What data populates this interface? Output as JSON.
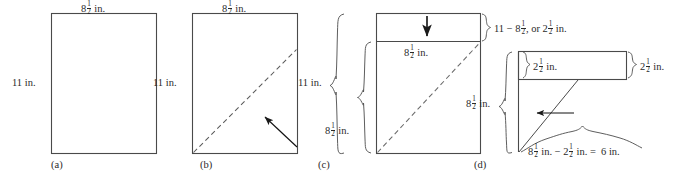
{
  "figure": {
    "background": "#ffffff",
    "line_color": "#3a3a3a",
    "text_color": "#2a2a2a",
    "panels": [
      {
        "id": "a",
        "label": "(a)",
        "description": "Plain 8 1/2 by 11 in. sheet of paper",
        "labels": [
          {
            "name": "width-label",
            "whole": "8",
            "num": "1",
            "den": "2",
            "unit": "in."
          },
          {
            "name": "height-label",
            "whole": "11",
            "num": "",
            "den": "",
            "unit": "in."
          }
        ]
      },
      {
        "id": "b",
        "label": "(b)",
        "description": "Sheet with dashed diagonal fold line and arrow indicating fold direction",
        "labels": [
          {
            "name": "width-label",
            "whole": "8",
            "num": "1",
            "den": "2",
            "unit": "in."
          },
          {
            "name": "height-label",
            "whole": "11",
            "num": "",
            "den": "",
            "unit": "in."
          }
        ]
      },
      {
        "id": "c",
        "label": "(c)",
        "description": "Folded sheet forming a triangle with leftover strip at top; arrow points down at strip",
        "labels": [
          {
            "name": "total-height-brace-label",
            "whole": "11",
            "num": "",
            "den": "",
            "unit": "in."
          },
          {
            "name": "square-side-brace-label",
            "whole": "8",
            "num": "1",
            "den": "2",
            "unit": "in."
          },
          {
            "name": "strip-width-label",
            "whole": "8",
            "num": "1",
            "den": "2",
            "unit": "in."
          }
        ]
      },
      {
        "id": "d",
        "label": "(d)",
        "description": "Leftover strip separated; strip is 2 1/2 in. tall; remaining length is 6 in.",
        "labels": [
          {
            "name": "strip-height-left-label",
            "whole": "2",
            "num": "1",
            "den": "2",
            "unit": "in."
          },
          {
            "name": "strip-height-right-label",
            "whole": "2",
            "num": "1",
            "den": "2",
            "unit": "in."
          },
          {
            "name": "square-side-brace-label",
            "whole": "8",
            "num": "1",
            "den": "2",
            "unit": "in."
          }
        ]
      }
    ],
    "equations": [
      {
        "name": "strip-height-equation",
        "id": "eq-strip",
        "text_plain": "11 - 8 1/2, or 2 1/2 in.",
        "parts": [
          {
            "type": "text",
            "value": "11 − 8"
          },
          {
            "type": "frac",
            "num": "1",
            "den": "2"
          },
          {
            "type": "text",
            "value": ", or 2"
          },
          {
            "type": "frac",
            "num": "1",
            "den": "2"
          },
          {
            "type": "text",
            "value": " in."
          }
        ]
      },
      {
        "name": "remaining-length-equation",
        "id": "eq-remaining",
        "text_plain": "8 1/2 in. - 2 1/2 in. = 6 in.",
        "parts": [
          {
            "type": "text",
            "value": "8"
          },
          {
            "type": "frac",
            "num": "1",
            "den": "2"
          },
          {
            "type": "text",
            "value": " in. − 2"
          },
          {
            "type": "frac",
            "num": "1",
            "den": "2"
          },
          {
            "type": "text",
            "value": " in. = 6 in."
          }
        ]
      }
    ],
    "measurements": {
      "paper_width_in": 8.5,
      "paper_height_in": 11,
      "strip_height_in": 2.5,
      "remaining_length_in": 6
    },
    "icons": [
      {
        "name": "fold-arrow-icon",
        "panel": "b",
        "direction": "up-left"
      },
      {
        "name": "down-arrow-icon",
        "panel": "c",
        "direction": "down"
      },
      {
        "name": "left-arrow-icon",
        "panel": "d",
        "direction": "left"
      }
    ]
  }
}
